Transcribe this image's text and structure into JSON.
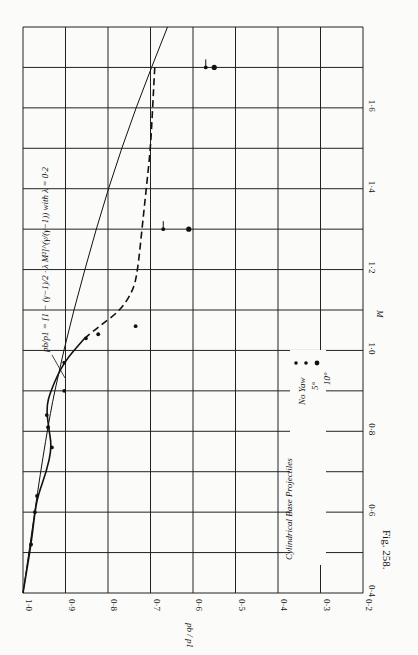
{
  "chart_data": {
    "type": "line",
    "orientation": "rotated 90 degrees clockwise (page printed sideways)",
    "title": "",
    "caption": "Fig. 258.",
    "xlabel": "M",
    "ylabel": "p_b / p_1",
    "x_axis": {
      "label": "M (Mach number)",
      "range": [
        0.4,
        1.8
      ],
      "ticks": [
        "0·4",
        "0·6",
        "0·8",
        "1·0",
        "1·2",
        "1·4",
        "1·6"
      ],
      "tick_values": [
        0.4,
        0.6,
        0.8,
        1.0,
        1.2,
        1.4,
        1.6
      ],
      "grid_step": 0.1
    },
    "y_axis": {
      "label": "p_b / p_1",
      "range": [
        0.2,
        1.0
      ],
      "ticks": [
        "1·0",
        "0·9",
        "0·8",
        "0·7",
        "0·6",
        "0·5",
        "0·4",
        "0·3",
        "0·2"
      ],
      "tick_values": [
        1.0,
        0.9,
        0.8,
        0.7,
        0.6,
        0.5,
        0.4,
        0.3,
        0.2
      ],
      "grid_step": 0.1
    },
    "grid": true,
    "annotation": "p_b/p_1 = [1 − (γ−1)/2 · λ M²]^(γ/(γ−1)) with λ = 0·2",
    "legend": {
      "title": "Cylindrical Base Projectiles",
      "entries": [
        {
          "label": "No Yaw",
          "marker": "dot"
        },
        {
          "label": "5°",
          "marker": "dot with tick"
        },
        {
          "label": "10°",
          "marker": "large dot"
        }
      ]
    },
    "series": [
      {
        "name": "Experimental curve (solid)",
        "style": "solid",
        "x": [
          0.4,
          0.52,
          0.6,
          0.64,
          0.7,
          0.76,
          0.81,
          0.86,
          0.9,
          0.97,
          1.03
        ],
        "y": [
          1.0,
          0.981,
          0.972,
          0.965,
          0.945,
          0.932,
          0.94,
          0.945,
          0.935,
          0.905,
          0.855
        ]
      },
      {
        "name": "Experimental curve (dashed extension)",
        "style": "dashed",
        "x": [
          1.03,
          1.06,
          1.1,
          1.15,
          1.2,
          1.3,
          1.4,
          1.5,
          1.6,
          1.7
        ],
        "y": [
          0.855,
          0.82,
          0.77,
          0.74,
          0.73,
          0.72,
          0.71,
          0.7,
          0.695,
          0.69
        ]
      },
      {
        "name": "Theoretical p_b/p_1 (λ = 0·2)",
        "style": "solid-thin",
        "x": [
          0.4,
          0.8,
          1.0,
          1.2,
          1.4,
          1.6,
          1.8
        ],
        "y": [
          1.0,
          0.945,
          0.905,
          0.855,
          0.8,
          0.735,
          0.66
        ]
      },
      {
        "name": "No Yaw points",
        "style": "markers",
        "x": [
          0.52,
          0.6,
          0.64,
          0.76,
          0.81,
          0.84,
          0.9,
          0.97,
          1.03,
          1.04,
          1.06
        ],
        "y": [
          0.981,
          0.972,
          0.967,
          0.932,
          0.941,
          0.944,
          0.903,
          0.903,
          0.852,
          0.823,
          0.735
        ]
      },
      {
        "name": "5° yaw points",
        "style": "markers-tick",
        "x": [
          1.3,
          1.7
        ],
        "y": [
          0.67,
          0.57
        ]
      },
      {
        "name": "10° yaw points",
        "style": "markers-large",
        "x": [
          1.3,
          1.7
        ],
        "y": [
          0.61,
          0.55
        ]
      }
    ]
  }
}
